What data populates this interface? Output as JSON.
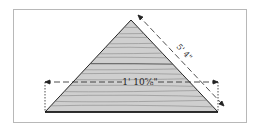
{
  "diagram": {
    "base_dimension": "1' 10⅝\"",
    "side_dimension": "5' 4\"",
    "colors": {
      "fill": "#c8c8c8",
      "grain": "#7a7a7a",
      "outline": "#222222",
      "frame": "#b8b8b8"
    }
  }
}
